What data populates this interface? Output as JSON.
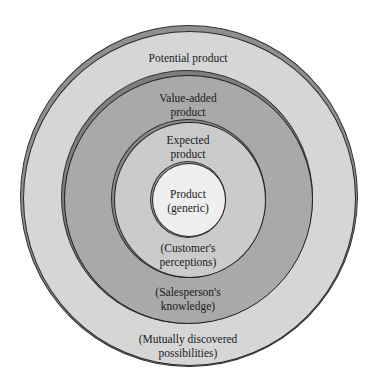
{
  "diagram": {
    "rings": [
      {
        "id": "potential",
        "label_top": "Potential product",
        "label_bottom": [
          "(Mutually discovered",
          "possibilities)"
        ],
        "fill": "#d6d6d6"
      },
      {
        "id": "value-added",
        "label_top": [
          "Value-added",
          "product"
        ],
        "label_bottom": [
          "(Salesperson's",
          "knowledge)"
        ],
        "fill": "#a9a9a9"
      },
      {
        "id": "expected",
        "label_top": [
          "Expected",
          "product"
        ],
        "label_bottom": [
          "(Customer's",
          "perceptions)"
        ],
        "fill": "#cbcbcb"
      },
      {
        "id": "generic",
        "label": [
          "Product",
          "(generic)"
        ],
        "fill": "#efefef"
      }
    ]
  }
}
